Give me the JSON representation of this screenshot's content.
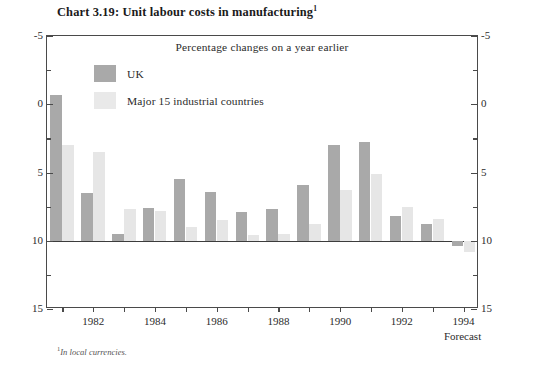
{
  "title": {
    "text": "Chart 3.19: Unit labour costs in manufacturing",
    "footnote_marker": "1"
  },
  "subtitle": "Percentage changes on a year earlier",
  "legend": {
    "items": [
      {
        "label": "UK",
        "color": "#a9a9a9",
        "key": "uk"
      },
      {
        "label": "Major 15 industrial countries",
        "color": "#e9e9e9",
        "key": "major"
      }
    ]
  },
  "forecast_note": "Forecast",
  "footnote": {
    "marker": "1",
    "text": "In local currencies."
  },
  "axis": {
    "y_left_labels": [
      "15",
      "10",
      "5",
      "0",
      "-5"
    ],
    "y_right_labels": [
      "15",
      "10",
      "5",
      "0",
      "-5"
    ],
    "x_labels": [
      "1982",
      "1984",
      "1986",
      "1988",
      "1990",
      "1992",
      "1994"
    ]
  },
  "chart_data": {
    "type": "bar",
    "title": "Chart 3.19: Unit labour costs in manufacturing",
    "subtitle": "Percentage changes on a year earlier",
    "xlabel": "",
    "ylabel": "Percentage changes on a year earlier",
    "ylim": [
      -5,
      15
    ],
    "ytick_values": [
      -5,
      0,
      5,
      10,
      15
    ],
    "yminor_step": 2.5,
    "grid": false,
    "legend_position": "upper-left-inside",
    "categories": [
      1981,
      1982,
      1983,
      1984,
      1985,
      1986,
      1987,
      1988,
      1989,
      1990,
      1991,
      1992,
      1993,
      1994
    ],
    "xtick_labels": [
      "1982",
      "1984",
      "1986",
      "1988",
      "1990",
      "1992",
      "1994"
    ],
    "xtick_categories": [
      1982,
      1984,
      1986,
      1988,
      1990,
      1992,
      1994
    ],
    "series": [
      {
        "name": "UK",
        "color": "#a9a9a9",
        "values": [
          10.7,
          3.5,
          0.5,
          2.4,
          4.5,
          3.6,
          2.1,
          2.3,
          4.1,
          7.0,
          7.25,
          1.8,
          1.2,
          -0.4
        ]
      },
      {
        "name": "Major 15 industrial countries",
        "color": "#e6e6e6",
        "values": [
          7.0,
          6.5,
          2.3,
          2.2,
          1.0,
          1.5,
          0.4,
          0.5,
          1.2,
          3.7,
          4.9,
          2.5,
          1.6,
          -0.8
        ]
      }
    ],
    "annotations": [
      {
        "text": "Forecast",
        "at_category": 1994,
        "position": "below-axis"
      }
    ],
    "notes": [
      "1 In local currencies."
    ]
  }
}
